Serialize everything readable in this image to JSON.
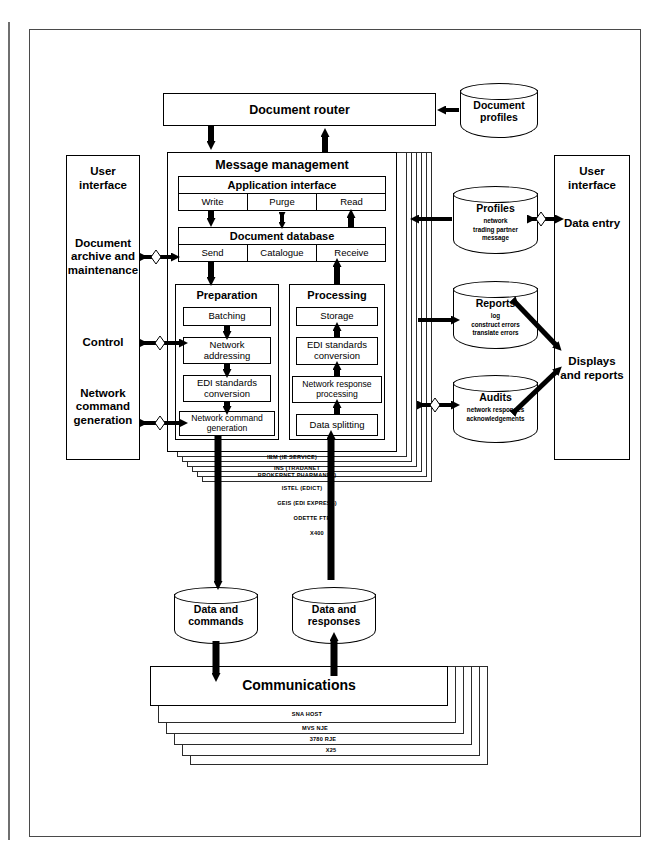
{
  "diagram": {
    "type": "block-architecture"
  },
  "top": {
    "document_router": "Document router",
    "document_profiles": "Document\nprofiles"
  },
  "left_panel": {
    "title": "User\ninterface",
    "items": [
      "Document\narchive and\nmaintenance",
      "Control",
      "Network\ncommand\ngeneration"
    ]
  },
  "right_panel": {
    "title": "User\ninterface",
    "items": [
      "Data entry",
      "Displays\nand reports"
    ]
  },
  "message_management": {
    "title": "Message management",
    "application_interface": {
      "title": "Application interface",
      "cells": [
        "Write",
        "Purge",
        "Read"
      ]
    },
    "document_database": {
      "title": "Document database",
      "cells": [
        "Send",
        "Catalogue",
        "Receive"
      ]
    },
    "preparation": {
      "title": "Preparation",
      "steps": [
        "Batching",
        "Network\naddressing",
        "EDI standards\nconversion",
        "Network command\ngeneration"
      ]
    },
    "processing": {
      "title": "Processing",
      "steps": [
        "Storage",
        "EDI standards\nconversion",
        "Network response\nprocessing",
        "Data splitting"
      ]
    },
    "network_layers": [
      "IBM (IE SERVICE)",
      "INS (TRADANET\nBROKERNET PHARMANET)",
      "ISTEL (EDICT)",
      "GEIS (EDI EXPRESS)",
      "ODETTE FTP",
      "X400",
      ""
    ]
  },
  "stores": [
    {
      "name": "Profiles",
      "details": "network\ntrading partner\nmessage"
    },
    {
      "name": "Reports",
      "details": "log\nconstruct errors\ntranslate errors"
    },
    {
      "name": "Audits",
      "details": "network responses\nacknowledgements"
    }
  ],
  "bottom": {
    "data_and_commands": "Data and\ncommands",
    "data_and_responses": "Data and\nresponses",
    "communications": {
      "title": "Communications",
      "layers": [
        "SNA HOST",
        "MVS NJE",
        "3780 RJE",
        "X25",
        ""
      ]
    }
  },
  "colors": {
    "line": "#000000",
    "frame": "#4a4a4a",
    "background": "#ffffff"
  }
}
